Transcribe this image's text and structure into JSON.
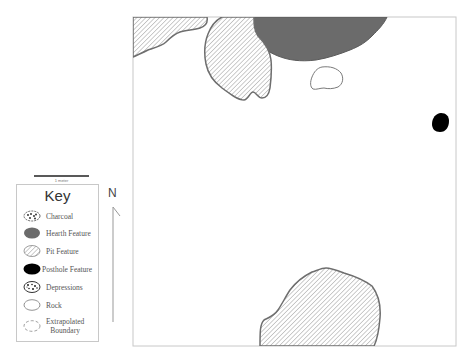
{
  "scale": {
    "label": "1 meter"
  },
  "north": {
    "label": "N"
  },
  "key": {
    "title": "Key",
    "items": [
      {
        "id": "charcoal",
        "label": "Charcoal",
        "icon": "charcoal-swatch"
      },
      {
        "id": "hearth",
        "label": "Hearth Feature",
        "icon": "hearth-swatch",
        "color": "#6b6b6b"
      },
      {
        "id": "pit",
        "label": "Pit Feature",
        "icon": "pit-hatch-swatch"
      },
      {
        "id": "posthole",
        "label": "Posthole Feature",
        "icon": "posthole-swatch",
        "color": "#000000"
      },
      {
        "id": "depressions",
        "label": "Depressions",
        "icon": "depressions-swatch"
      },
      {
        "id": "rock",
        "label": "Rock",
        "icon": "rock-swatch"
      },
      {
        "id": "extrapolated",
        "label_line1": "Extrapolated",
        "label_line2": "Boundary",
        "icon": "dashed-boundary-swatch"
      }
    ]
  },
  "map": {
    "features": [
      {
        "type": "pit",
        "location": "top-left corner"
      },
      {
        "type": "pit",
        "location": "top, left-center"
      },
      {
        "type": "hearth",
        "location": "top-center"
      },
      {
        "type": "rock",
        "location": "below hearth"
      },
      {
        "type": "posthole",
        "location": "right edge"
      },
      {
        "type": "pit",
        "location": "bottom-center"
      }
    ]
  },
  "colors": {
    "hearth": "#6b6b6b",
    "posthole": "#000000",
    "outline": "#777777",
    "border": "#c8c8c8"
  }
}
